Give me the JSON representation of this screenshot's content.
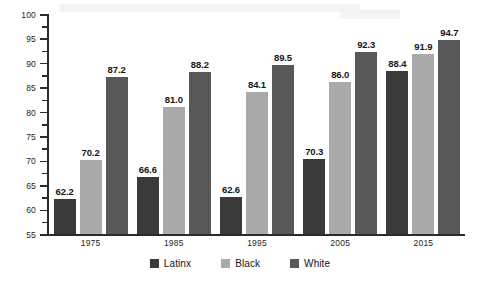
{
  "chart_data": {
    "type": "bar",
    "title": "",
    "xlabel": "",
    "ylabel": "",
    "ylim": [
      55,
      100
    ],
    "ytick_step": 5,
    "yticks": [
      55,
      60,
      65,
      70,
      75,
      80,
      85,
      90,
      95,
      100
    ],
    "grid": false,
    "legend_position": "bottom",
    "categories": [
      "1975",
      "1985",
      "1995",
      "2005",
      "2015"
    ],
    "series": [
      {
        "name": "Latinx",
        "color": "#3a3a3a",
        "values": [
          62.2,
          66.6,
          62.6,
          70.3,
          88.4
        ],
        "labels": [
          "62.2",
          "66.6",
          "62.6",
          "70.3",
          "88.4"
        ]
      },
      {
        "name": "Black",
        "color": "#aaaaaa",
        "values": [
          70.2,
          81.0,
          84.1,
          86.0,
          91.9
        ],
        "labels": [
          "70.2",
          "81.0",
          "84.1",
          "86.0",
          "91.9"
        ]
      },
      {
        "name": "White",
        "color": "#585858",
        "values": [
          87.2,
          88.2,
          89.5,
          92.3,
          94.7
        ],
        "labels": [
          "87.2",
          "88.2",
          "89.5",
          "92.3",
          "94.7"
        ]
      }
    ]
  },
  "axis": {
    "y_tick_labels": [
      "100",
      "95",
      "90",
      "85",
      "80",
      "75",
      "70",
      "65",
      "60",
      "55"
    ]
  },
  "legend": {
    "items": [
      {
        "label": "Latinx"
      },
      {
        "label": "Black"
      },
      {
        "label": "White"
      }
    ]
  }
}
